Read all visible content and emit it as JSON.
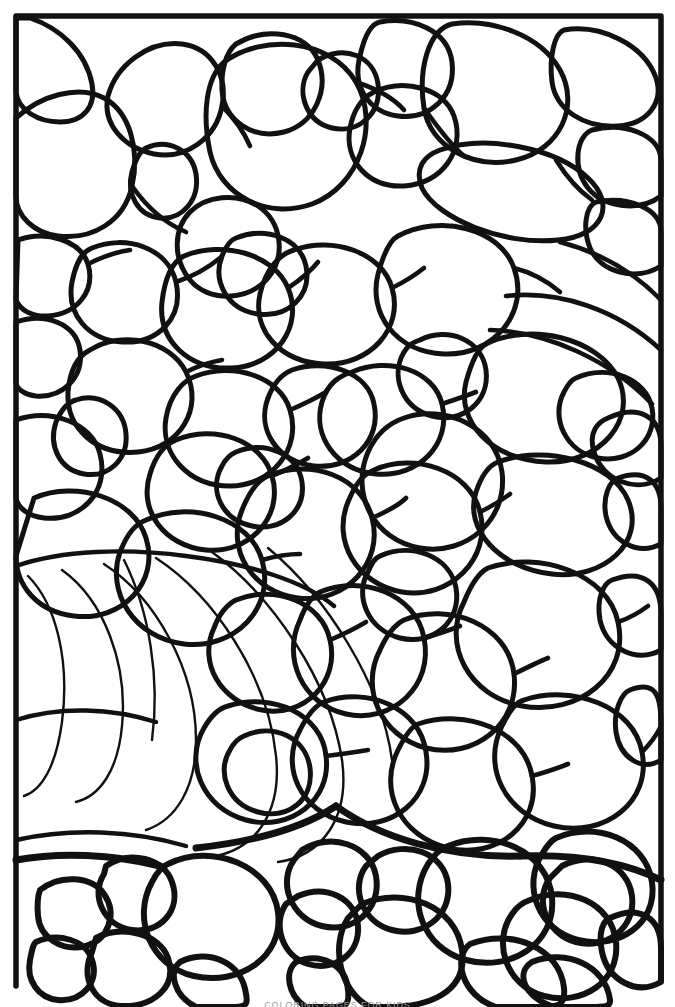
{
  "document": {
    "title": "Floral Stained-Glass Coloring Page",
    "media": "line-art",
    "background_color": "#ffffff",
    "ink_color": "#111111"
  },
  "frame": {
    "name": "rectangular-border",
    "stroke_color": "#111111",
    "stroke_width_px": 5,
    "left_px": 14,
    "top_px": 14,
    "right_px": 662,
    "bottom_open": true,
    "bottom_terminus_px": 986
  },
  "artwork": {
    "style": "stained-glass floral mosaic",
    "cell_fill": "#ffffff",
    "outline_color": "#111111",
    "thick_stroke_px": 5.5,
    "medium_stroke_px": 3.2,
    "thin_stroke_px": 1.8,
    "motifs": [
      {
        "name": "petal-cluster-top-left",
        "region": "top-left"
      },
      {
        "name": "petal-cluster-top-center",
        "region": "top-center"
      },
      {
        "name": "petal-cluster-top-right",
        "region": "top-right"
      },
      {
        "name": "blossom-center-right",
        "region": "center-right"
      },
      {
        "name": "leaf-fan-lower-left",
        "region": "lower-left"
      },
      {
        "name": "blossom-bottom-left",
        "region": "bottom-left"
      },
      {
        "name": "blossom-bottom-center",
        "region": "bottom-center"
      },
      {
        "name": "blossom-bottom-right",
        "region": "bottom-right"
      }
    ]
  },
  "caption": {
    "text": "COLORING PAGES FOR KIDS",
    "visible": "clipped at lower page edge",
    "color": "#9a9a9a"
  }
}
